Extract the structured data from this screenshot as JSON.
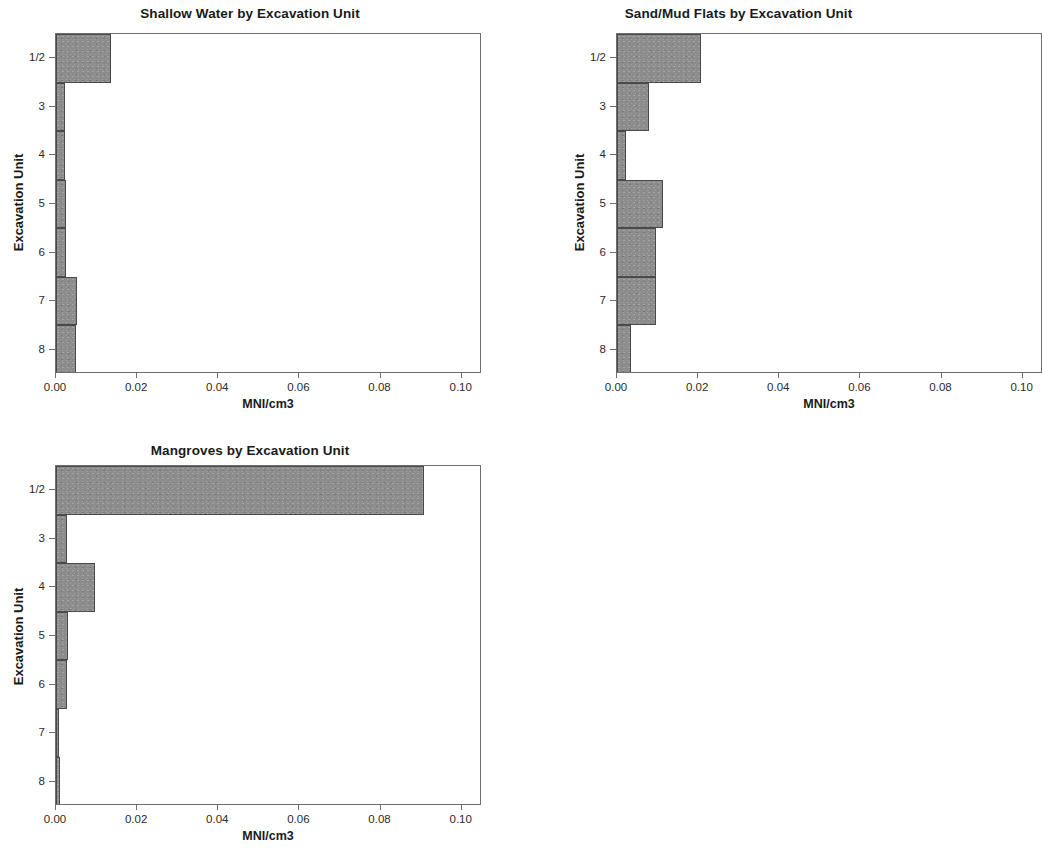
{
  "page": {
    "background": "#ffffff",
    "bar_fill": "#8c8c8c",
    "bar_border": "#4a4a4a",
    "axis_color": "#6e6e6e"
  },
  "charts": [
    {
      "id": "shallow-water",
      "title": "Shallow Water by Excavation Unit",
      "xlabel": "MNI/cm3",
      "ylabel": "Excavation Unit",
      "xticks": [
        "0.00",
        "0.02",
        "0.04",
        "0.06",
        "0.08",
        "0.10"
      ],
      "categories": [
        "1/2",
        "3",
        "4",
        "5",
        "6",
        "7",
        "8"
      ],
      "values": [
        0.0136,
        0.0022,
        0.0022,
        0.0025,
        0.0025,
        0.0052,
        0.0049
      ]
    },
    {
      "id": "sand-mud-flats",
      "title": "Sand/Mud Flats by Excavation Unit",
      "xlabel": "MNI/cm3",
      "ylabel": "Excavation Unit",
      "xticks": [
        "0.00",
        "0.02",
        "0.04",
        "0.06",
        "0.08",
        "0.10"
      ],
      "categories": [
        "1/2",
        "3",
        "4",
        "5",
        "6",
        "7",
        "8"
      ],
      "values": [
        0.0208,
        0.0079,
        0.0022,
        0.0114,
        0.0096,
        0.0096,
        0.0035
      ]
    },
    {
      "id": "mangroves",
      "title": "Mangroves by Excavation Unit",
      "xlabel": "MNI/cm3",
      "ylabel": "Excavation Unit",
      "xticks": [
        "0.00",
        "0.02",
        "0.04",
        "0.06",
        "0.08",
        "0.10"
      ],
      "categories": [
        "1/2",
        "3",
        "4",
        "5",
        "6",
        "7",
        "8"
      ],
      "values": [
        0.0906,
        0.0028,
        0.0095,
        0.003,
        0.0028,
        0.0008,
        0.001
      ]
    }
  ],
  "chart_data": [
    {
      "type": "bar",
      "orientation": "horizontal",
      "title": "Shallow Water by Excavation Unit",
      "xlabel": "MNI/cm3",
      "ylabel": "Excavation Unit",
      "categories": [
        "1/2",
        "3",
        "4",
        "5",
        "6",
        "7",
        "8"
      ],
      "values": [
        0.0136,
        0.0022,
        0.0022,
        0.0025,
        0.0025,
        0.0052,
        0.0049
      ],
      "xlim": [
        0.0,
        0.105
      ],
      "xticks": [
        0.0,
        0.02,
        0.04,
        0.06,
        0.08,
        0.1
      ],
      "xticklabels": [
        "0.00",
        "0.02",
        "0.04",
        "0.06",
        "0.08",
        "0.10"
      ],
      "grid": false,
      "legend": false,
      "bar_color": "#8c8c8c"
    },
    {
      "type": "bar",
      "orientation": "horizontal",
      "title": "Sand/Mud Flats by Excavation Unit",
      "xlabel": "MNI/cm3",
      "ylabel": "Excavation Unit",
      "categories": [
        "1/2",
        "3",
        "4",
        "5",
        "6",
        "7",
        "8"
      ],
      "values": [
        0.0208,
        0.0079,
        0.0022,
        0.0114,
        0.0096,
        0.0096,
        0.0035
      ],
      "xlim": [
        0.0,
        0.105
      ],
      "xticks": [
        0.0,
        0.02,
        0.04,
        0.06,
        0.08,
        0.1
      ],
      "xticklabels": [
        "0.00",
        "0.02",
        "0.04",
        "0.06",
        "0.08",
        "0.10"
      ],
      "grid": false,
      "legend": false,
      "bar_color": "#8c8c8c",
      "note": "panel is clipped at the right edge of the image"
    },
    {
      "type": "bar",
      "orientation": "horizontal",
      "title": "Mangroves by Excavation Unit",
      "xlabel": "MNI/cm3",
      "ylabel": "Excavation Unit",
      "categories": [
        "1/2",
        "3",
        "4",
        "5",
        "6",
        "7",
        "8"
      ],
      "values": [
        0.0906,
        0.0028,
        0.0095,
        0.003,
        0.0028,
        0.0008,
        0.001
      ],
      "xlim": [
        0.0,
        0.105
      ],
      "xticks": [
        0.0,
        0.02,
        0.04,
        0.06,
        0.08,
        0.1
      ],
      "xticklabels": [
        "0.00",
        "0.02",
        "0.04",
        "0.06",
        "0.08",
        "0.10"
      ],
      "grid": false,
      "legend": false,
      "bar_color": "#8c8c8c"
    }
  ]
}
